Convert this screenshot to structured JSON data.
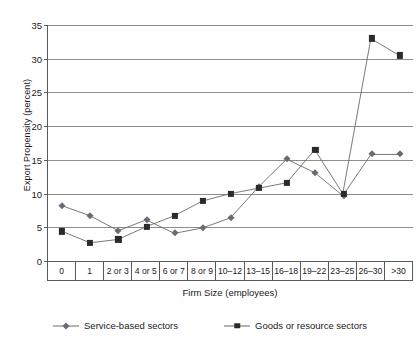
{
  "chart_data": {
    "type": "line",
    "title": "",
    "xlabel": "Firm Size (employees)",
    "ylabel": "Export Propensity (percent)",
    "ylim": [
      0,
      35
    ],
    "ytick_step": 5,
    "yticks": [
      0,
      5,
      10,
      15,
      20,
      25,
      30,
      35
    ],
    "grid": true,
    "legend_position": "bottom",
    "categories": [
      "0",
      "1",
      "2 or 3",
      "4 or 5",
      "6 or 7",
      "8 or 9",
      "10–12",
      "13–15",
      "16–18",
      "19–22",
      "23–25",
      "26–30",
      ">30"
    ],
    "series": [
      {
        "name": "Service-based sectors",
        "marker": "diamond",
        "color": "#6a6a76",
        "values": [
          8.2,
          6.7,
          4.5,
          6.1,
          4.1,
          4.9,
          6.4,
          11.0,
          15.1,
          13.1,
          9.7,
          15.8,
          15.8
        ]
      },
      {
        "name": "Goods or resource sectors",
        "marker": "square",
        "color": "#2b2b2b",
        "values": [
          4.4,
          2.7,
          3.2,
          5.1,
          6.7,
          8.9,
          10.0,
          10.8,
          11.6,
          16.5,
          10.0,
          33.0,
          30.5
        ]
      }
    ]
  },
  "legend": {
    "entries": [
      {
        "label": "Service-based sectors"
      },
      {
        "label": "Goods or resource sectors"
      }
    ]
  }
}
